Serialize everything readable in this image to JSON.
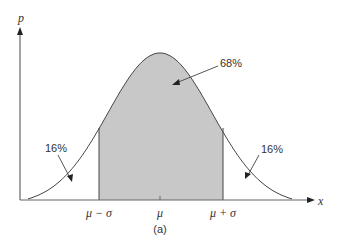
{
  "figure": {
    "caption": "(a)",
    "y_axis_label": "p",
    "x_axis_label": "x",
    "tick_labels": [
      "μ − σ",
      "μ",
      "μ + σ"
    ],
    "annotations": {
      "center": "68%",
      "left_tail": "16%",
      "right_tail": "16%"
    },
    "colors": {
      "shade": "#c8c8c8",
      "line": "#444444"
    }
  },
  "chart_data": {
    "type": "area",
    "title": "",
    "xlabel": "x",
    "ylabel": "p",
    "x_ticks": [
      "μ − σ",
      "μ",
      "μ + σ"
    ],
    "regions": [
      {
        "name": "left tail (x < μ − σ)",
        "percent": 16
      },
      {
        "name": "central (μ − σ to μ + σ)",
        "percent": 68
      },
      {
        "name": "right tail (x > μ + σ)",
        "percent": 16
      }
    ],
    "grid": false,
    "legend": null
  }
}
